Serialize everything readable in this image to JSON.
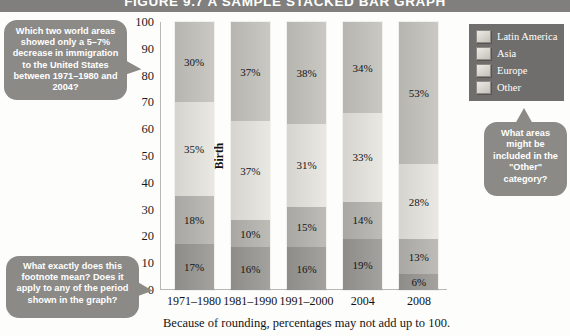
{
  "figure": {
    "title": "FIGURE 9.7  A SAMPLE STACKED BAR GRAPH",
    "footnote": "Because of rounding, percentages may not add up to 100."
  },
  "legend": {
    "items": [
      {
        "label": "Latin America",
        "swatch": "legend-swatch-latin-america"
      },
      {
        "label": "Asia",
        "swatch": "legend-swatch-asia"
      },
      {
        "label": "Europe",
        "swatch": "legend-swatch-europe"
      },
      {
        "label": "Other",
        "swatch": "legend-swatch-other"
      }
    ]
  },
  "callouts": [
    {
      "id": "callout-left",
      "text": "Which two world areas showed only a 5–7% decrease in immigration to the United States between 1971–1980 and 2004?"
    },
    {
      "id": "callout-bottom",
      "text": "What exactly does this footnote mean? Does it apply to any of the period shown in the graph?"
    },
    {
      "id": "callout-right",
      "text": "What areas might be included in the \"Other\" category?"
    }
  ],
  "chart_data": {
    "type": "bar",
    "stacked": true,
    "title": "FIGURE 9.7  A SAMPLE STACKED BAR GRAPH",
    "xlabel": "",
    "ylabel": "Percent of U.S. Immigration by Region of Birth",
    "ylim": [
      0,
      100
    ],
    "yticks": [
      0,
      10,
      20,
      30,
      40,
      50,
      60,
      70,
      80,
      90,
      100
    ],
    "grid": false,
    "legend_position": "top-right",
    "categories": [
      "1971–1980",
      "1981–1990",
      "1991–2000",
      "2004",
      "2008"
    ],
    "series": [
      {
        "name": "Latin America",
        "values": [
          17,
          16,
          16,
          19,
          6
        ],
        "color": "#95948f"
      },
      {
        "name": "Europe",
        "values": [
          18,
          10,
          15,
          14,
          13
        ],
        "color": "#b2b1ac"
      },
      {
        "name": "Asia",
        "values": [
          35,
          37,
          31,
          33,
          28
        ],
        "color": "#dfded9"
      },
      {
        "name": "Other",
        "values": [
          30,
          37,
          38,
          34,
          53
        ],
        "color": "#c0bfba"
      }
    ],
    "stack_order_bottom_to_top": [
      "Latin America",
      "Europe",
      "Asia",
      "Other"
    ],
    "data_labels": [
      {
        "category": "1971–1980",
        "labels": [
          "17%",
          "18%",
          "35%",
          "30%"
        ]
      },
      {
        "category": "1981–1990",
        "labels": [
          "16%",
          "10%",
          "37%",
          "37%"
        ]
      },
      {
        "category": "1991–2000",
        "labels": [
          "16%",
          "15%",
          "31%",
          "38%"
        ]
      },
      {
        "category": "2004",
        "labels": [
          "19%",
          "14%",
          "33%",
          "34%"
        ]
      },
      {
        "category": "2008",
        "labels": [
          "6%",
          "13%",
          "28%",
          "53%"
        ]
      }
    ],
    "footnote": "Because of rounding, percentages may not add up to 100."
  }
}
